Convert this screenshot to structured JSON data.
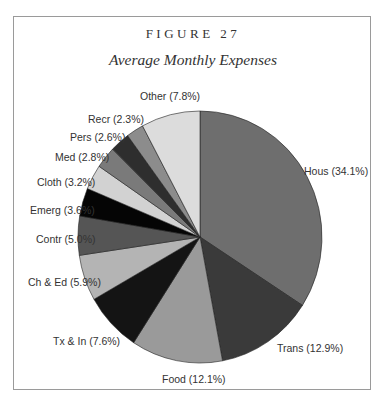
{
  "figure": {
    "label": "FIGURE 27",
    "title": "Average Monthly Expenses"
  },
  "chart_data": {
    "type": "pie",
    "title": "Average Monthly Expenses",
    "start_angle_deg": 0,
    "direction": "clockwise",
    "slices": [
      {
        "name": "Hous",
        "value": 34.1,
        "label": "Hous (34.1%)",
        "color": "#6e6e6e"
      },
      {
        "name": "Trans",
        "value": 12.9,
        "label": "Trans (12.9%)",
        "color": "#3a3a3a"
      },
      {
        "name": "Food",
        "value": 12.1,
        "label": "Food (12.1%)",
        "color": "#9a9a9a"
      },
      {
        "name": "Tx & In",
        "value": 7.6,
        "label": "Tx & In (7.6%)",
        "color": "#141414"
      },
      {
        "name": "Ch & Ed",
        "value": 5.9,
        "label": "Ch & Ed (5.9%)",
        "color": "#b4b4b4"
      },
      {
        "name": "Contr",
        "value": 5.0,
        "label": "Contr (5.0%)",
        "color": "#555555"
      },
      {
        "name": "Emerg",
        "value": 3.6,
        "label": "Emerg (3.6%)",
        "color": "#050505"
      },
      {
        "name": "Cloth",
        "value": 3.2,
        "label": "Cloth (3.2%)",
        "color": "#d2d2d2"
      },
      {
        "name": "Med",
        "value": 2.8,
        "label": "Med (2.8%)",
        "color": "#7a7a7a"
      },
      {
        "name": "Pers",
        "value": 2.6,
        "label": "Pers (2.6%)",
        "color": "#2e2e2e"
      },
      {
        "name": "Recr",
        "value": 2.3,
        "label": "Recr (2.3%)",
        "color": "#8c8c8c"
      },
      {
        "name": "Other",
        "value": 7.8,
        "label": "Other (7.8%)",
        "color": "#dcdcdc"
      }
    ]
  }
}
